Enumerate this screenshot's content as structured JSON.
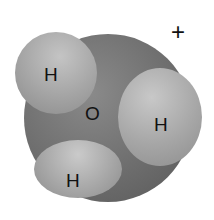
{
  "diagram": {
    "molecule": "hydronium",
    "charge": "+",
    "atoms": [
      {
        "symbol": "O",
        "role": "central"
      },
      {
        "symbol": "H",
        "role": "upper-left"
      },
      {
        "symbol": "H",
        "role": "right"
      },
      {
        "symbol": "H",
        "role": "lower-left"
      }
    ],
    "colors": {
      "oxygen": "#6f6f6f",
      "hydrogen": "#a8a8a8",
      "label": "#111111"
    }
  }
}
